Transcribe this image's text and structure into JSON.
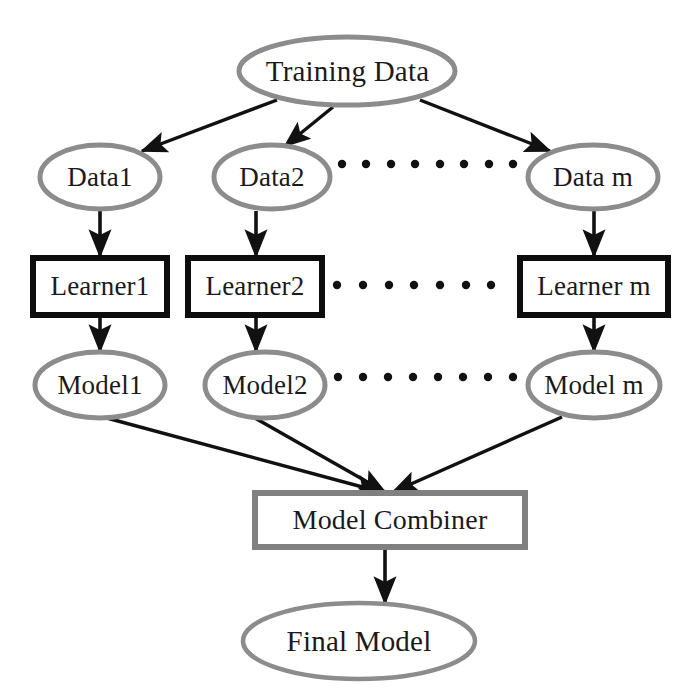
{
  "diagram": {
    "colors": {
      "ellipse_stroke": "#8c8c8c",
      "learner_box_stroke": "#0d0d0d",
      "combiner_box_stroke": "#808080",
      "arrow": "#111111",
      "dot": "#111111",
      "text": "#1a1a1a",
      "background": "#ffffff"
    },
    "nodes": {
      "training_data": {
        "label": "Training Data",
        "shape": "ellipse",
        "cx": 347,
        "cy": 71,
        "rx": 108,
        "ry": 34
      },
      "data_1": {
        "label": "Data1",
        "shape": "ellipse",
        "cx": 100,
        "cy": 177,
        "rx": 60,
        "ry": 32
      },
      "data_2": {
        "label": "Data2",
        "shape": "ellipse",
        "cx": 272,
        "cy": 177,
        "rx": 58,
        "ry": 32
      },
      "data_m": {
        "label": "Data m",
        "shape": "ellipse",
        "cx": 593,
        "cy": 177,
        "rx": 65,
        "ry": 32
      },
      "learner_1": {
        "label": "Learner1",
        "shape": "rect",
        "x": 33,
        "y": 258,
        "w": 134,
        "h": 57
      },
      "learner_2": {
        "label": "Learner2",
        "shape": "rect",
        "x": 188,
        "y": 258,
        "w": 134,
        "h": 57
      },
      "learner_m": {
        "label": "Learner m",
        "shape": "rect",
        "x": 520,
        "y": 258,
        "w": 148,
        "h": 57
      },
      "model_1": {
        "label": "Model1",
        "shape": "ellipse",
        "cx": 100,
        "cy": 385,
        "rx": 65,
        "ry": 33
      },
      "model_2": {
        "label": "Model2",
        "shape": "ellipse",
        "cx": 265,
        "cy": 385,
        "rx": 60,
        "ry": 33
      },
      "model_m": {
        "label": "Model m",
        "shape": "ellipse",
        "cx": 594,
        "cy": 385,
        "rx": 66,
        "ry": 33
      },
      "model_combiner": {
        "label": "Model Combiner",
        "shape": "rect",
        "x": 255,
        "y": 493,
        "w": 270,
        "h": 54
      },
      "final_model": {
        "label": "Final Model",
        "shape": "ellipse",
        "cx": 359,
        "cy": 641,
        "rx": 116,
        "ry": 38
      }
    },
    "ellipsis_rows": [
      {
        "name": "data-row-ellipsis",
        "count": 8,
        "x_start": 342,
        "x_end": 513,
        "y": 164
      },
      {
        "name": "learner-row-ellipsis",
        "count": 7,
        "x_start": 337,
        "x_end": 491,
        "y": 285
      },
      {
        "name": "model-row-ellipsis",
        "count": 8,
        "x_start": 338,
        "x_end": 513,
        "y": 377
      }
    ],
    "edges": [
      {
        "name": "training-data-to-data-1",
        "from": "training_data",
        "to": "data_1",
        "x1": 277,
        "y1": 100,
        "x2": 140,
        "y2": 152
      },
      {
        "name": "training-data-to-data-2",
        "from": "training_data",
        "to": "data_2",
        "x1": 332,
        "y1": 106,
        "x2": 283,
        "y2": 147
      },
      {
        "name": "training-data-to-data-m",
        "from": "training_data",
        "to": "data_m",
        "x1": 420,
        "y1": 100,
        "x2": 552,
        "y2": 152
      },
      {
        "name": "data-1-to-learner-1",
        "from": "data_1",
        "to": "learner_1",
        "x1": 100,
        "y1": 211,
        "x2": 100,
        "y2": 255
      },
      {
        "name": "data-2-to-learner-2",
        "from": "data_2",
        "to": "learner_2",
        "x1": 256,
        "y1": 211,
        "x2": 256,
        "y2": 255
      },
      {
        "name": "data-m-to-learner-m",
        "from": "data_m",
        "to": "learner_m",
        "x1": 594,
        "y1": 211,
        "x2": 594,
        "y2": 255
      },
      {
        "name": "learner-1-to-model-1",
        "from": "learner_1",
        "to": "model_1",
        "x1": 100,
        "y1": 317,
        "x2": 100,
        "y2": 350
      },
      {
        "name": "learner-2-to-model-2",
        "from": "learner_2",
        "to": "model_2",
        "x1": 256,
        "y1": 317,
        "x2": 256,
        "y2": 350
      },
      {
        "name": "learner-m-to-model-m",
        "from": "learner_m",
        "to": "model_m",
        "x1": 594,
        "y1": 317,
        "x2": 594,
        "y2": 350
      },
      {
        "name": "model-1-to-combiner",
        "from": "model_1",
        "to": "model_combiner",
        "x1": 105,
        "y1": 418,
        "x2": 383,
        "y2": 493
      },
      {
        "name": "model-2-to-combiner",
        "from": "model_2",
        "to": "model_combiner",
        "x1": 258,
        "y1": 418,
        "x2": 385,
        "y2": 493
      },
      {
        "name": "model-m-to-combiner",
        "from": "model_m",
        "to": "model_combiner",
        "x1": 560,
        "y1": 418,
        "x2": 392,
        "y2": 493
      },
      {
        "name": "combiner-to-final-model",
        "from": "model_combiner",
        "to": "final_model",
        "x1": 385,
        "y1": 547,
        "x2": 385,
        "y2": 602
      }
    ]
  }
}
